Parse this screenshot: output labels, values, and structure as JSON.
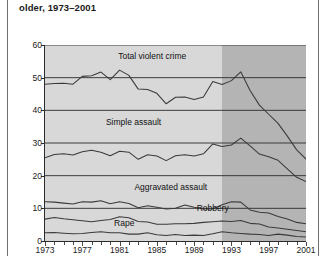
{
  "title": "older, 1973–2001",
  "colors": {
    "plot_background": "#d8d8d8",
    "plot_background_shaded": "#b4b4b4",
    "line": "#3a3a3a",
    "axis": "#2b2b2b",
    "text": "#1a1a1a"
  },
  "chart_data": {
    "type": "line",
    "title": "older, 1973–2001",
    "xlabel": "",
    "ylabel": "",
    "xlim": [
      1973,
      2001
    ],
    "ylim": [
      0,
      60
    ],
    "yticks": [
      0,
      10,
      20,
      30,
      40,
      50,
      60
    ],
    "ytick_labels": [
      "0",
      "10",
      "20",
      "30",
      "40",
      "50",
      "60"
    ],
    "xticks": [
      1973,
      1977,
      1981,
      1985,
      1989,
      1993,
      1997,
      2001
    ],
    "xtick_labels": [
      "1973",
      "1977",
      "1981",
      "1985",
      "1989",
      "1993",
      "1997",
      "2001"
    ],
    "grid": true,
    "grid_axis": "y",
    "legend": "inline-labels",
    "shaded_region": {
      "from": 1992,
      "to": 2001,
      "color": "#b4b4b4"
    },
    "x": [
      1973,
      1974,
      1975,
      1976,
      1977,
      1978,
      1979,
      1980,
      1981,
      1982,
      1983,
      1984,
      1985,
      1986,
      1987,
      1988,
      1989,
      1990,
      1991,
      1992,
      1993,
      1994,
      1995,
      1996,
      1997,
      1998,
      1999,
      2000,
      2001
    ],
    "series": [
      {
        "name": "Total violent crime",
        "values": [
          48.0,
          48.2,
          48.3,
          48.0,
          50.4,
          50.6,
          51.7,
          49.4,
          52.3,
          50.7,
          46.5,
          46.4,
          45.2,
          42.0,
          44.0,
          44.1,
          43.3,
          44.1,
          48.8,
          47.9,
          49.1,
          51.8,
          46.1,
          41.6,
          38.8,
          36.0,
          32.1,
          27.9,
          25.1
        ]
      },
      {
        "name": "Simple assault",
        "values": [
          25.5,
          26.5,
          26.7,
          26.3,
          27.3,
          27.8,
          27.2,
          26.1,
          27.5,
          27.2,
          25.0,
          26.4,
          26.0,
          24.6,
          26.1,
          26.4,
          26.0,
          26.7,
          29.7,
          28.9,
          29.4,
          31.5,
          29.1,
          26.6,
          25.8,
          24.7,
          22.1,
          19.5,
          18.2
        ]
      },
      {
        "name": "Aggravated assault",
        "values": [
          12.0,
          11.9,
          11.6,
          11.3,
          12.0,
          11.9,
          12.3,
          11.4,
          12.0,
          11.5,
          10.2,
          10.8,
          10.3,
          9.8,
          10.0,
          11.0,
          10.3,
          9.8,
          9.9,
          11.1,
          12.0,
          11.9,
          9.5,
          8.8,
          8.6,
          7.5,
          6.7,
          5.7,
          5.3
        ]
      },
      {
        "name": "Robbery",
        "values": [
          6.7,
          7.2,
          6.8,
          6.5,
          6.2,
          5.9,
          6.3,
          6.6,
          7.4,
          7.1,
          6.0,
          5.8,
          5.1,
          5.1,
          5.3,
          5.3,
          5.4,
          5.7,
          5.9,
          6.1,
          6.0,
          6.3,
          5.4,
          5.2,
          4.3,
          4.0,
          3.6,
          3.2,
          2.8
        ]
      },
      {
        "name": "Rape",
        "values": [
          2.5,
          2.6,
          2.4,
          2.2,
          2.3,
          2.6,
          2.8,
          2.5,
          2.5,
          2.1,
          2.1,
          2.5,
          1.9,
          1.7,
          2.0,
          1.7,
          1.8,
          1.7,
          2.2,
          2.8,
          2.5,
          2.3,
          2.1,
          2.0,
          1.7,
          2.1,
          1.8,
          1.4,
          1.2
        ]
      }
    ],
    "series_label_positions": [
      {
        "name": "Total violent crime",
        "x": 1984.5,
        "y": 56.5
      },
      {
        "name": "Simple assault",
        "x": 1982.5,
        "y": 36.5
      },
      {
        "name": "Aggravated assault",
        "x": 1986.5,
        "y": 16.5
      },
      {
        "name": "Robbery",
        "x": 1991.0,
        "y": 10.2
      },
      {
        "name": "Rape",
        "x": 1981.5,
        "y": 5.4
      }
    ]
  }
}
